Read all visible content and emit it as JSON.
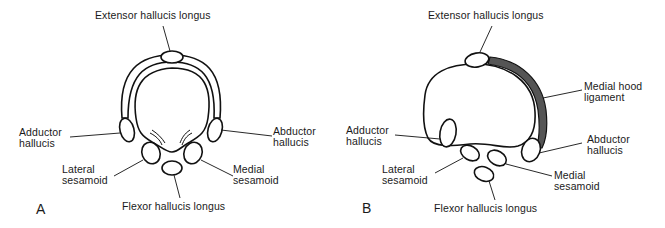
{
  "figure": {
    "panels": [
      {
        "letter": "A",
        "labels": {
          "extensor": "Extensor hallucis longus",
          "adductor": [
            "Adductor",
            "hallucis"
          ],
          "abductor": [
            "Abductor",
            "hallucis"
          ],
          "lateral_sesamoid": [
            "Lateral",
            "sesamoid"
          ],
          "medial_sesamoid": [
            "Medial",
            "sesamoid"
          ],
          "flexor": "Flexor hallucis longus"
        }
      },
      {
        "letter": "B",
        "labels": {
          "extensor": "Extensor hallucis longus",
          "medial_hood": [
            "Medial hood",
            "ligament"
          ],
          "adductor": [
            "Adductor",
            "hallucis"
          ],
          "abductor": [
            "Abductor",
            "hallucis"
          ],
          "lateral_sesamoid": [
            "Lateral",
            "sesamoid"
          ],
          "medial_sesamoid": [
            "Medial",
            "sesamoid"
          ],
          "flexor": "Flexor hallucis longus"
        }
      }
    ]
  }
}
